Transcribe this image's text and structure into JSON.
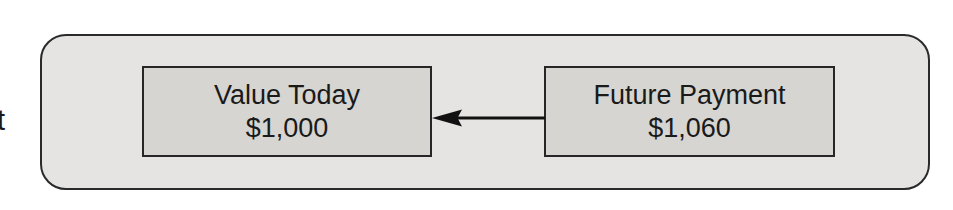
{
  "figure": {
    "margin_fragment": "t",
    "left_box": {
      "title": "Value Today",
      "amount": "$1,000"
    },
    "right_box": {
      "title": "Future Payment",
      "amount": "$1,060"
    },
    "arrow": {
      "direction": "right-to-left"
    },
    "colors": {
      "panel_fill": "#e5e4e2",
      "box_fill": "#d6d5d2",
      "border": "#2a2a2a",
      "text": "#1a1a1a",
      "arrow": "#111111"
    }
  }
}
